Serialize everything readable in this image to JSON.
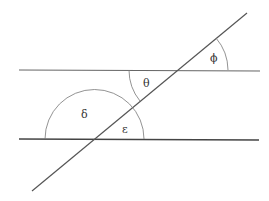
{
  "diagram": {
    "colors": {
      "line": "#555555",
      "arc": "#666666",
      "label": "#333333",
      "background": "#ffffff"
    },
    "angles": [
      {
        "id": "phi",
        "label": "ϕ"
      },
      {
        "id": "theta",
        "label": "θ"
      },
      {
        "id": "delta",
        "label": "δ"
      },
      {
        "id": "epsilon",
        "label": "ε"
      }
    ]
  }
}
